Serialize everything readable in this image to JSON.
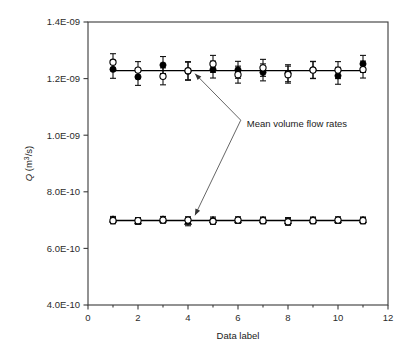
{
  "chart_data": {
    "type": "scatter",
    "title": "",
    "xlabel": "Data label",
    "ylabel": "Q (m3/s)",
    "ylabel_display": "Q (m³/s)",
    "xlim": [
      0,
      12
    ],
    "ylim": [
      4e-10,
      1.4e-09
    ],
    "grid": false,
    "legend": null,
    "x_ticks": [
      0,
      2,
      4,
      6,
      8,
      10,
      12
    ],
    "x_tick_labels": [
      "0",
      "2",
      "4",
      "6",
      "8",
      "10",
      "12"
    ],
    "x_minor_ticks": [
      1,
      3,
      5,
      7,
      9,
      11
    ],
    "y_ticks": [
      4e-10,
      6e-10,
      8e-10,
      1e-09,
      1.2e-09,
      1.4e-09
    ],
    "y_tick_labels": [
      "4.0E-10",
      "6.0E-10",
      "8.0E-10",
      "1.0E-09",
      "1.2E-09",
      "1.4E-09"
    ],
    "x": [
      1,
      2,
      3,
      4,
      5,
      6,
      7,
      8,
      9,
      10,
      11
    ],
    "series": [
      {
        "name": "upper-filled-circle",
        "marker": "filled-circle",
        "values": [
          1.233e-09,
          1.206e-09,
          1.248e-09,
          1.226e-09,
          1.232e-09,
          1.231e-09,
          1.222e-09,
          1.219e-09,
          1.231e-09,
          1.21e-09,
          1.252e-09
        ],
        "errors": [
          3.2e-11,
          3e-11,
          3e-11,
          3.2e-11,
          3e-11,
          3e-11,
          3e-11,
          3e-11,
          3e-11,
          3e-11,
          3e-11
        ]
      },
      {
        "name": "upper-open-circle",
        "marker": "open-circle",
        "values": [
          1.258e-09,
          1.23e-09,
          1.208e-09,
          1.228e-09,
          1.252e-09,
          1.214e-09,
          1.238e-09,
          1.214e-09,
          1.23e-09,
          1.23e-09,
          1.232e-09
        ],
        "errors": [
          3e-11,
          3e-11,
          3e-11,
          3.2e-11,
          3e-11,
          3e-11,
          3e-11,
          3e-11,
          3e-11,
          3e-11,
          3e-11
        ]
      },
      {
        "name": "lower-filled-triangle",
        "marker": "filled-triangle",
        "values": [
          7.02e-10,
          6.96e-10,
          7.02e-10,
          6.94e-10,
          7e-10,
          7e-10,
          7e-10,
          6.96e-10,
          7e-10,
          7e-10,
          7e-10
        ],
        "errors": [
          1.1e-11,
          1.1e-11,
          1.1e-11,
          1.4e-11,
          1.1e-11,
          1.1e-11,
          1.1e-11,
          1.3e-11,
          1.1e-11,
          1.1e-11,
          1.1e-11
        ]
      },
      {
        "name": "lower-open-circle",
        "marker": "open-circle",
        "values": [
          6.98e-10,
          6.98e-10,
          7e-10,
          7e-10,
          6.96e-10,
          7e-10,
          6.98e-10,
          6.94e-10,
          6.98e-10,
          7e-10,
          6.98e-10
        ],
        "errors": [
          1.1e-11,
          1.1e-11,
          1.1e-11,
          1.2e-11,
          1.1e-11,
          1.1e-11,
          1.1e-11,
          1.2e-11,
          1.1e-11,
          1.1e-11,
          1.1e-11
        ]
      }
    ],
    "mean_lines": [
      {
        "name": "upper-mean-volume-flow-rate",
        "value": 1.2285e-09,
        "x_from": 1,
        "x_to": 11
      },
      {
        "name": "lower-mean-volume-flow-rate",
        "value": 6.985e-10,
        "x_from": 1,
        "x_to": 11
      }
    ],
    "annotations": [
      {
        "name": "mean-volume-flow-rates",
        "text": "Mean volume flow rates",
        "text_x": 6.35,
        "text_y": 1.0425e-09,
        "points_to": [
          {
            "x": 4.28,
            "y": 1.2175e-09
          },
          {
            "x": 4.28,
            "y": 7.17e-10
          }
        ]
      }
    ],
    "colors": {
      "axis": "#3a3a3a",
      "marker_fill": "#000000",
      "marker_open_fill": "#ffffff",
      "mean_line": "#000000",
      "leader_line": "#555555",
      "background": "#ffffff"
    }
  }
}
